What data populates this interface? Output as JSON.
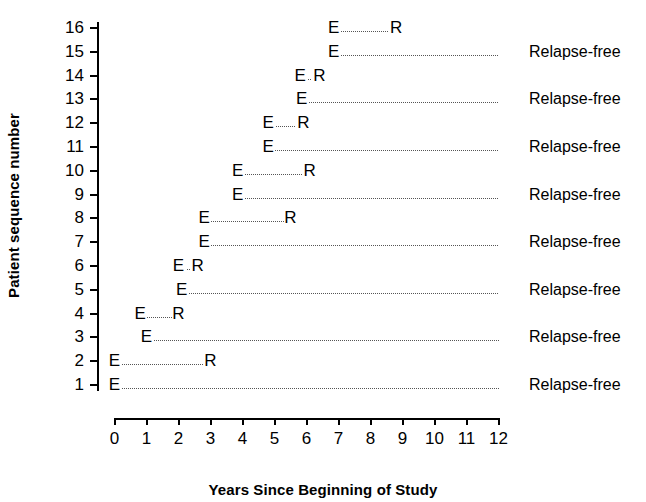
{
  "chart_data": {
    "type": "timeline",
    "title": "",
    "xlabel": "Years Since Beginning of Study",
    "ylabel": "Patient sequence number",
    "xlim": [
      0,
      12
    ],
    "ylim": [
      1,
      16
    ],
    "xticks": [
      "0",
      "1",
      "2",
      "3",
      "4",
      "5",
      "6",
      "7",
      "8",
      "9",
      "10",
      "11",
      "12"
    ],
    "yticks": [
      "1",
      "2",
      "3",
      "4",
      "5",
      "6",
      "7",
      "8",
      "9",
      "10",
      "11",
      "12",
      "13",
      "14",
      "15",
      "16"
    ],
    "grid": false,
    "legend": "none",
    "marker_labels": {
      "entry": "E",
      "relapse": "R"
    },
    "censor_label": "Relapse-free",
    "rows": [
      {
        "patient": 1,
        "entry_year": 0.0,
        "end_year": 12.0,
        "end_marker": "",
        "censored": true,
        "status_label": "Relapse-free"
      },
      {
        "patient": 2,
        "entry_year": 0.0,
        "end_year": 3.0,
        "end_marker": "R",
        "censored": false,
        "status_label": ""
      },
      {
        "patient": 3,
        "entry_year": 1.0,
        "end_year": 12.0,
        "end_marker": "",
        "censored": true,
        "status_label": "Relapse-free"
      },
      {
        "patient": 4,
        "entry_year": 0.8,
        "end_year": 2.0,
        "end_marker": "R",
        "censored": false,
        "status_label": ""
      },
      {
        "patient": 5,
        "entry_year": 2.1,
        "end_year": 12.0,
        "end_marker": "",
        "censored": true,
        "status_label": "Relapse-free"
      },
      {
        "patient": 6,
        "entry_year": 2.0,
        "end_year": 2.6,
        "end_marker": "R",
        "censored": false,
        "status_label": ""
      },
      {
        "patient": 7,
        "entry_year": 2.8,
        "end_year": 12.0,
        "end_marker": "",
        "censored": true,
        "status_label": "Relapse-free"
      },
      {
        "patient": 8,
        "entry_year": 2.8,
        "end_year": 5.5,
        "end_marker": "R",
        "censored": false,
        "status_label": ""
      },
      {
        "patient": 9,
        "entry_year": 3.85,
        "end_year": 12.0,
        "end_marker": "",
        "censored": true,
        "status_label": "Relapse-free"
      },
      {
        "patient": 10,
        "entry_year": 3.85,
        "end_year": 6.1,
        "end_marker": "R",
        "censored": false,
        "status_label": ""
      },
      {
        "patient": 11,
        "entry_year": 4.8,
        "end_year": 12.0,
        "end_marker": "",
        "censored": true,
        "status_label": "Relapse-free"
      },
      {
        "patient": 12,
        "entry_year": 4.8,
        "end_year": 5.9,
        "end_marker": "R",
        "censored": false,
        "status_label": ""
      },
      {
        "patient": 13,
        "entry_year": 5.85,
        "end_year": 12.0,
        "end_marker": "",
        "censored": true,
        "status_label": "Relapse-free"
      },
      {
        "patient": 14,
        "entry_year": 5.8,
        "end_year": 6.4,
        "end_marker": "R",
        "censored": false,
        "status_label": ""
      },
      {
        "patient": 15,
        "entry_year": 6.85,
        "end_year": 12.0,
        "end_marker": "",
        "censored": true,
        "status_label": "Relapse-free"
      },
      {
        "patient": 16,
        "entry_year": 6.85,
        "end_year": 8.8,
        "end_marker": "R",
        "censored": false,
        "status_label": ""
      }
    ]
  },
  "geometry": {
    "x0_px": 114.5,
    "x12_px": 498.5,
    "y1_px": 385,
    "y16_px": 28,
    "line_color": "#555555",
    "axis_color": "#000000"
  }
}
